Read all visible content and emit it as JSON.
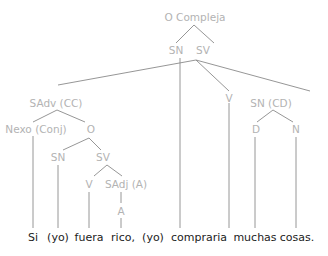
{
  "diagram": {
    "type": "syntax-tree",
    "colors": {
      "node_label": "#b3b3b3",
      "edge": "#8a8a8a",
      "word": "#222222"
    },
    "nodes": {
      "root": "O Compleja",
      "root_sn": "SN",
      "root_sv": "SV",
      "sadv": "SAdv (CC)",
      "nexo": "Nexo (Conj)",
      "sub_o": "O",
      "sub_sn": "SN",
      "sub_sv": "SV",
      "sub_v": "V",
      "sadj": "SAdj (A)",
      "adj_a": "A",
      "main_v": "V",
      "sn_cd": "SN (CD)",
      "det": "D",
      "noun": "N"
    },
    "words": [
      "Si",
      "(yo)",
      "fuera",
      "rico,",
      "(yo)",
      "compraria",
      "muchas",
      "cosas."
    ]
  }
}
